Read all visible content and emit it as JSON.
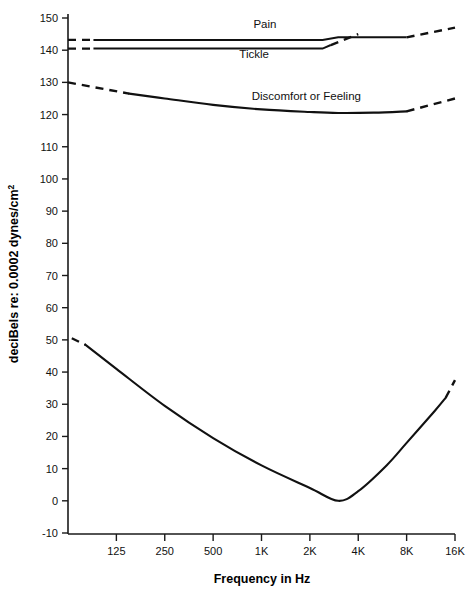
{
  "chart_data": {
    "type": "line",
    "title": "",
    "xlabel": "Frequency in Hz",
    "ylabel": "deciBels re: 0.0002 dynes/cm",
    "ylabel_superscript": "2",
    "xlabel_ticks": [
      "125",
      "250",
      "500",
      "1K",
      "2K",
      "4K",
      "8K",
      "16K"
    ],
    "x_tick_values": [
      125,
      250,
      500,
      1000,
      2000,
      4000,
      8000,
      16000
    ],
    "ylabel_ticks": [
      "150",
      "140",
      "130",
      "120",
      "110",
      "100",
      "90",
      "80",
      "70",
      "60",
      "50",
      "40",
      "30",
      "20",
      "10",
      "0",
      "-10"
    ],
    "y_tick_values": [
      150,
      140,
      130,
      120,
      110,
      100,
      90,
      80,
      70,
      60,
      50,
      40,
      30,
      20,
      10,
      0,
      -10
    ],
    "ylim": [
      -10,
      150
    ],
    "xlim_hz": [
      62.5,
      16000
    ],
    "xscale": "log2",
    "grid": false,
    "legend_position": "inline-annotations",
    "series": [
      {
        "name": "Pain",
        "label": "Pain",
        "label_hz": 1050,
        "label_db": 147,
        "solid_points": [
          [
            90,
            143.2
          ],
          [
            1000,
            143.2
          ],
          [
            2400,
            143.2
          ],
          [
            3000,
            144.0
          ],
          [
            8000,
            144.0
          ]
        ],
        "dashed_left": [
          [
            62.5,
            143.2
          ],
          [
            90,
            143.2
          ]
        ],
        "dashed_right": [
          [
            8000,
            144.0
          ],
          [
            16000,
            147.0
          ]
        ]
      },
      {
        "name": "Tickle",
        "label": "Tickle",
        "label_hz": 900,
        "label_db": 137.5,
        "solid_points": [
          [
            90,
            140.5
          ],
          [
            2400,
            140.5
          ],
          [
            2700,
            141.6
          ]
        ],
        "dashed_left": [
          [
            62.5,
            140.5
          ],
          [
            90,
            140.5
          ]
        ],
        "dashed_right": [
          [
            2700,
            141.6
          ],
          [
            4000,
            145.0
          ]
        ]
      },
      {
        "name": "Discomfort or Feeling",
        "label": "Discomfort or Feeling",
        "label_hz": 1900,
        "label_db": 124.5,
        "solid_points": [
          [
            150,
            126.5
          ],
          [
            250,
            125.0
          ],
          [
            500,
            123.0
          ],
          [
            1000,
            121.6
          ],
          [
            2000,
            120.8
          ],
          [
            3000,
            120.5
          ],
          [
            5000,
            120.6
          ],
          [
            8000,
            121.0
          ]
        ],
        "dashed_left": [
          [
            62.5,
            130.0
          ],
          [
            150,
            126.5
          ]
        ],
        "dashed_right": [
          [
            8000,
            121.0
          ],
          [
            16000,
            125.0
          ]
        ]
      },
      {
        "name": "Threshold of Hearing",
        "label": "",
        "solid_points": [
          [
            80,
            48.5
          ],
          [
            125,
            41.0
          ],
          [
            250,
            29.5
          ],
          [
            500,
            19.5
          ],
          [
            1000,
            11.0
          ],
          [
            2000,
            4.0
          ],
          [
            3000,
            0.0
          ],
          [
            4000,
            3.0
          ],
          [
            6000,
            11.0
          ],
          [
            8000,
            18.0
          ],
          [
            12000,
            28.0
          ],
          [
            14000,
            32.0
          ]
        ],
        "dashed_left": [
          [
            66,
            50.5
          ],
          [
            80,
            48.5
          ]
        ],
        "dashed_right": [
          [
            14000,
            32.0
          ],
          [
            16000,
            37.5
          ]
        ]
      }
    ],
    "colors": {
      "line": "#111111",
      "axis": "#1a1a1a",
      "background": "#ffffff"
    }
  }
}
